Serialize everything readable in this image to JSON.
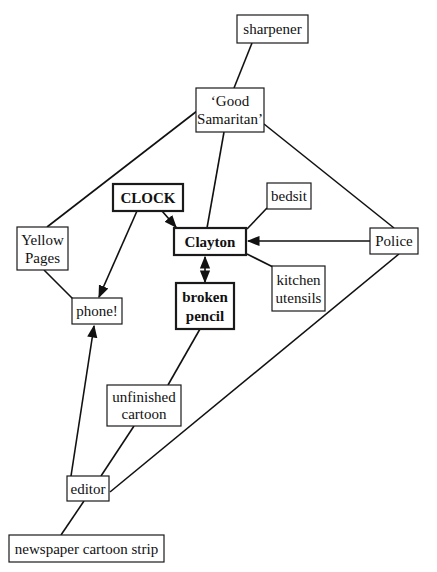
{
  "diagram": {
    "type": "concept-map",
    "nodes": [
      {
        "id": "sharpener",
        "lines": [
          "sharpener"
        ],
        "bold": false
      },
      {
        "id": "good-samaritan",
        "lines": [
          "‘Good",
          "Samaritan’"
        ],
        "bold": false
      },
      {
        "id": "clock",
        "lines": [
          "CLOCK"
        ],
        "bold": true
      },
      {
        "id": "bedsit",
        "lines": [
          "bedsit"
        ],
        "bold": false
      },
      {
        "id": "yellow-pages",
        "lines": [
          "Yellow",
          "Pages"
        ],
        "bold": false
      },
      {
        "id": "clayton",
        "lines": [
          "Clayton"
        ],
        "bold": true
      },
      {
        "id": "police",
        "lines": [
          "Police"
        ],
        "bold": false
      },
      {
        "id": "kitchen-utensils",
        "lines": [
          "kitchen",
          "utensils"
        ],
        "bold": false
      },
      {
        "id": "phone",
        "lines": [
          "phone!"
        ],
        "bold": false
      },
      {
        "id": "broken-pencil",
        "lines": [
          "broken",
          "pencil"
        ],
        "bold": true
      },
      {
        "id": "unfinished-cartoon",
        "lines": [
          "unfinished",
          "cartoon"
        ],
        "bold": false
      },
      {
        "id": "editor",
        "lines": [
          "editor"
        ],
        "bold": false
      },
      {
        "id": "newspaper-cartoon-strip",
        "lines": [
          "newspaper cartoon strip"
        ],
        "bold": false
      }
    ],
    "edges": [
      {
        "from": "sharpener",
        "to": "good-samaritan",
        "arrow": "none"
      },
      {
        "from": "good-samaritan",
        "to": "yellow-pages",
        "arrow": "none"
      },
      {
        "from": "good-samaritan",
        "to": "clayton",
        "arrow": "none"
      },
      {
        "from": "good-samaritan",
        "to": "police",
        "arrow": "none"
      },
      {
        "from": "clock",
        "to": "clayton",
        "arrow": "end"
      },
      {
        "from": "clock",
        "to": "phone",
        "arrow": "end"
      },
      {
        "from": "bedsit",
        "to": "clayton",
        "arrow": "none"
      },
      {
        "from": "police",
        "to": "clayton",
        "arrow": "end"
      },
      {
        "from": "kitchen-utensils",
        "to": "clayton",
        "arrow": "none"
      },
      {
        "from": "clayton",
        "to": "broken-pencil",
        "arrow": "both"
      },
      {
        "from": "yellow-pages",
        "to": "phone",
        "arrow": "none"
      },
      {
        "from": "broken-pencil",
        "to": "unfinished-cartoon",
        "arrow": "none"
      },
      {
        "from": "editor",
        "to": "phone",
        "arrow": "end"
      },
      {
        "from": "unfinished-cartoon",
        "to": "editor",
        "arrow": "none"
      },
      {
        "from": "police",
        "to": "editor",
        "arrow": "none"
      },
      {
        "from": "editor",
        "to": "newspaper-cartoon-strip",
        "arrow": "none"
      }
    ]
  },
  "labels": {
    "sharpener": "sharpener",
    "good_samaritan_1": "‘Good",
    "good_samaritan_2": "Samaritan’",
    "clock": "CLOCK",
    "bedsit": "bedsit",
    "yellow_pages_1": "Yellow",
    "yellow_pages_2": "Pages",
    "clayton": "Clayton",
    "police": "Police",
    "kitchen_utensils_1": "kitchen",
    "kitchen_utensils_2": "utensils",
    "phone": "phone!",
    "broken_pencil_1": "broken",
    "broken_pencil_2": "pencil",
    "unfinished_cartoon_1": "unfinished",
    "unfinished_cartoon_2": "cartoon",
    "editor": "editor",
    "newspaper_cartoon_strip": "newspaper cartoon strip"
  }
}
